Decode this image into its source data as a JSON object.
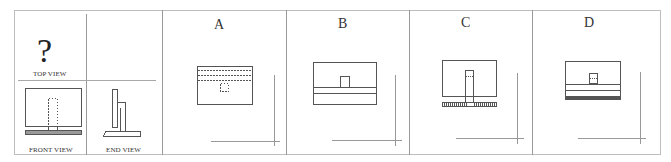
{
  "question": {
    "mark": "?",
    "top_view_label": "TOP VIEW",
    "front_view_label": "FRONT VIEW",
    "end_view_label": "END VIEW"
  },
  "options": [
    {
      "letter": "A"
    },
    {
      "letter": "B"
    },
    {
      "letter": "C"
    },
    {
      "letter": "D"
    }
  ],
  "colors": {
    "line": "#555555",
    "border": "#bdbdbd",
    "divider": "#9a9a9a"
  }
}
